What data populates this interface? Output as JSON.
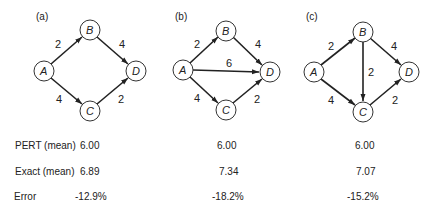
{
  "diagrams": [
    {
      "label": "(a)",
      "nodes": {
        "A": "A",
        "B": "B",
        "C": "C",
        "D": "D"
      },
      "edges": [
        {
          "from": "A",
          "to": "B",
          "weight": "2"
        },
        {
          "from": "B",
          "to": "D",
          "weight": "4"
        },
        {
          "from": "A",
          "to": "C",
          "weight": "4"
        },
        {
          "from": "C",
          "to": "D",
          "weight": "2"
        }
      ]
    },
    {
      "label": "(b)",
      "nodes": {
        "A": "A",
        "B": "B",
        "C": "C",
        "D": "D"
      },
      "edges": [
        {
          "from": "A",
          "to": "B",
          "weight": "2"
        },
        {
          "from": "B",
          "to": "D",
          "weight": "4"
        },
        {
          "from": "A",
          "to": "D",
          "weight": "6"
        },
        {
          "from": "A",
          "to": "C",
          "weight": "4"
        },
        {
          "from": "C",
          "to": "D",
          "weight": "2"
        }
      ]
    },
    {
      "label": "(c)",
      "nodes": {
        "A": "A",
        "B": "B",
        "C": "C",
        "D": "D"
      },
      "edges": [
        {
          "from": "A",
          "to": "B",
          "weight": "2"
        },
        {
          "from": "B",
          "to": "D",
          "weight": "4"
        },
        {
          "from": "B",
          "to": "C",
          "weight": "2"
        },
        {
          "from": "A",
          "to": "C",
          "weight": "4"
        },
        {
          "from": "C",
          "to": "D",
          "weight": "2"
        }
      ]
    }
  ],
  "table": {
    "rows": [
      {
        "label": "PERT (mean)",
        "values": [
          "6.00",
          "6.00",
          "6.00"
        ]
      },
      {
        "label": "Exact (mean)",
        "values": [
          "6.89",
          "7.34",
          "7.07"
        ]
      },
      {
        "label": "Error",
        "values": [
          "-12.9%",
          "-18.2%",
          "-15.2%"
        ]
      }
    ]
  }
}
